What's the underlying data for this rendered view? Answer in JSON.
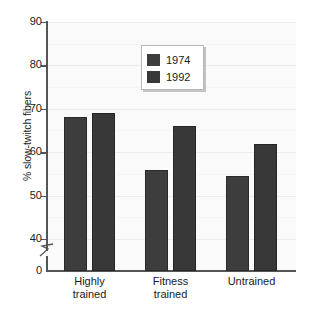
{
  "chart_data": {
    "type": "bar",
    "title": "",
    "xlabel": "",
    "ylabel": "% slow-twitch fibers",
    "categories": [
      "Highly trained",
      "Fitness trained",
      "Untrained"
    ],
    "category_lines": [
      [
        "Highly",
        "trained"
      ],
      [
        "Fitness",
        "trained"
      ],
      [
        "Untrained"
      ]
    ],
    "series": [
      {
        "name": "1974",
        "values": [
          68,
          56,
          54.5
        ],
        "color": "#3d3d3d"
      },
      {
        "name": "1992",
        "values": [
          69,
          66,
          62
        ],
        "color": "#383838"
      }
    ],
    "ylim": [
      0,
      90
    ],
    "y_display_min": 37,
    "y_major_ticks": [
      90,
      80,
      70,
      60,
      50,
      40
    ],
    "y_zero_tick": 0,
    "y_minor_step": 5,
    "axis_break": true,
    "grid": true,
    "legend_position": "top-center"
  },
  "legend": {
    "entries": [
      {
        "label": "1974"
      },
      {
        "label": "1992"
      }
    ]
  },
  "axes": {
    "y_tick_labels": [
      "90",
      "80",
      "70",
      "60",
      "50",
      "40",
      "0"
    ]
  },
  "colors": {
    "bar_1974": "#3d3d3d",
    "bar_1992": "#383838",
    "plot_background": "#fafafa",
    "grid_major": "#ededed",
    "axis": "#555555",
    "text": "#1a1a1a"
  }
}
